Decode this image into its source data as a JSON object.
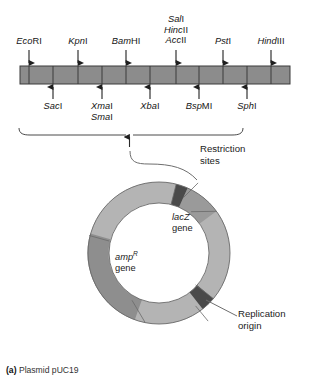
{
  "figure": {
    "caption_label": "(a)",
    "caption_text": "Plasmid pUC19"
  },
  "restriction_map": {
    "bar": {
      "x": 20,
      "y": 66,
      "width": 270,
      "height": 18,
      "fill": "#8c8c8c",
      "stroke": "#3a3a3a"
    },
    "top_sites": [
      {
        "id": "ecori",
        "italic": "Eco",
        "roman": "RI",
        "x": 29,
        "lines": [
          "EcoRI"
        ]
      },
      {
        "id": "kpni",
        "italic": "Kpn",
        "roman": "I",
        "x": 78,
        "lines": [
          "KpnI"
        ]
      },
      {
        "id": "bamhi",
        "italic": "Bam",
        "roman": "HI",
        "x": 126,
        "lines": [
          "BamHI"
        ]
      },
      {
        "id": "sali-group",
        "italic": "Sal",
        "roman": "I",
        "x": 176,
        "lines": [
          "SalI",
          "HincII",
          "AccII"
        ]
      },
      {
        "id": "psti",
        "italic": "Pst",
        "roman": "I",
        "x": 223,
        "lines": [
          "PstI"
        ]
      },
      {
        "id": "hindiii",
        "italic": "Hind",
        "roman": "III",
        "x": 271,
        "lines": [
          "HindIII"
        ]
      }
    ],
    "bottom_sites": [
      {
        "id": "saci",
        "italic": "Sac",
        "roman": "I",
        "x": 53,
        "lines": [
          "SacI"
        ]
      },
      {
        "id": "xmai-smai",
        "italic": "Xma",
        "roman": "I",
        "x": 102,
        "lines": [
          "XmaI",
          "SmaI"
        ]
      },
      {
        "id": "xbai",
        "italic": "Xba",
        "roman": "I",
        "x": 150,
        "lines": [
          "XbaI"
        ]
      },
      {
        "id": "bspmi",
        "italic": "Bsp",
        "roman": "MI",
        "x": 199,
        "lines": [
          "BspMI"
        ]
      },
      {
        "id": "sphi",
        "italic": "Sph",
        "roman": "I",
        "x": 247,
        "lines": [
          "SphI"
        ]
      }
    ],
    "tick_positions": [
      29,
      53,
      78,
      102,
      126,
      150,
      176,
      199,
      223,
      247,
      271
    ],
    "bracket_label": "Restriction\nsites"
  },
  "labels": {
    "restriction_sites_line1": "Restriction",
    "restriction_sites_line2": "sites",
    "lacz_gene_italic": "lacZ",
    "lacz_gene_rest": "gene",
    "amp_gene_italic": "amp",
    "amp_gene_sup": "R",
    "amp_gene_rest": "gene",
    "replication_origin_line1": "Replication",
    "replication_origin_line2": "origin"
  },
  "plasmid": {
    "center_x": 159,
    "center_y": 253,
    "outer_radius": 71,
    "inner_radius": 50,
    "segments": [
      {
        "name": "restriction-sites-segment",
        "start_deg": -76,
        "end_deg": -66,
        "fill": "#4a4a4a"
      },
      {
        "name": "lacz-segment",
        "start_deg": -66,
        "end_deg": -36,
        "fill": "#9a9a9a"
      },
      {
        "name": "backbone-upper-right",
        "start_deg": -36,
        "end_deg": 40,
        "fill": "#b4b4b4"
      },
      {
        "name": "replication-origin-segment",
        "start_deg": 40,
        "end_deg": 52,
        "fill": "#4a4a4a"
      },
      {
        "name": "backbone-lower-right",
        "start_deg": 52,
        "end_deg": 110,
        "fill": "#b4b4b4"
      },
      {
        "name": "amp-segment",
        "start_deg": 110,
        "end_deg": 196,
        "fill": "#8e8e8e"
      },
      {
        "name": "backbone-upper-left",
        "start_deg": 196,
        "end_deg": 284,
        "fill": "#b4b4b4"
      }
    ],
    "outline_color": "#555555"
  },
  "colors": {
    "bar_fill": "#8c8c8c",
    "bar_stroke": "#3a3a3a",
    "ring_light": "#b4b4b4",
    "ring_mid": "#9a9a9a",
    "ring_dark": "#4a4a4a",
    "text": "#1b1b1b",
    "leader": "#6e6e6e",
    "background": "#ffffff"
  }
}
